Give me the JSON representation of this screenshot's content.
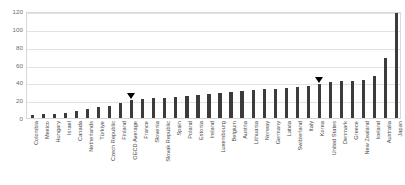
{
  "chart_data": {
    "type": "bar",
    "title": "",
    "subtitle": "",
    "xlabel": "",
    "ylabel": "",
    "ylim": [
      0,
      120
    ],
    "yticks": [
      0,
      20,
      40,
      60,
      80,
      100,
      120
    ],
    "grid": true,
    "legend": null,
    "bar_color": "#3b3b3b",
    "categories": [
      "Colombia",
      "Mexico",
      "Hungary",
      "Israel",
      "Canada",
      "Netherlands",
      "Türkiye",
      "Czech Republic",
      "Finland",
      "OECD Average",
      "France",
      "Slovenia",
      "Slovak Republic",
      "Spain",
      "Poland",
      "Estonia",
      "Ireland",
      "Luxembourg",
      "Belgium",
      "Austria",
      "Lithuania",
      "Norway",
      "Germany",
      "Latvia",
      "Switzerland",
      "Italy",
      "Korea",
      "United States",
      "Denmark",
      "Greece",
      "New Zealand",
      "Iceland",
      "Australia",
      "Japan"
    ],
    "values": [
      3,
      4,
      5,
      6,
      8,
      10,
      12,
      14,
      17,
      20,
      21,
      22,
      23,
      24,
      25,
      26,
      27,
      28,
      29,
      30,
      31,
      32,
      33,
      34,
      35,
      36,
      38,
      40,
      41,
      42,
      43,
      47,
      67,
      118
    ],
    "annotations": [
      {
        "label": "OECD Average",
        "category": "OECD Average",
        "marker": "down-triangle"
      },
      {
        "label": "Korea",
        "category": "Korea",
        "marker": "down-triangle"
      }
    ]
  }
}
